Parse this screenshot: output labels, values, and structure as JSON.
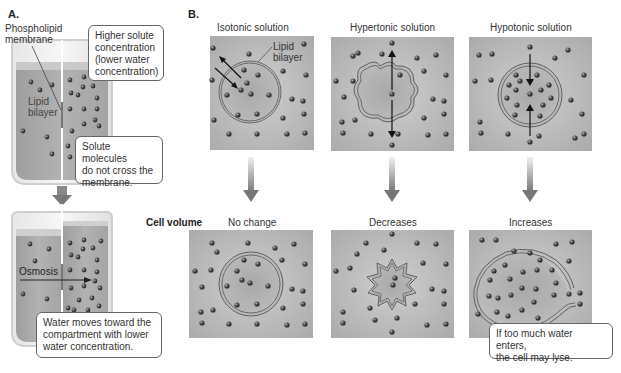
{
  "part_a": {
    "label": "A.",
    "membrane_label": "Phospholipid membrane",
    "membrane_label_line1": "Phospholipid",
    "membrane_label_line2": "membrane",
    "lipid_label_line1": "Lipid",
    "lipid_label_line2": "bilayer",
    "callout_concentration": "Higher solute concentration (lower water concentration)",
    "callout_concentration_lines": [
      "Higher solute",
      "concentration",
      "(lower water",
      "concentration)"
    ],
    "callout_solute": "Solute molecules do not cross the membrane.",
    "callout_solute_lines": [
      "Solute molecules",
      "do not cross the",
      "membrane."
    ],
    "osmosis_label": "Osmosis",
    "callout_water": "Water moves toward the compartment with lower water concentration.",
    "callout_water_lines": [
      "Water moves toward the",
      "compartment with lower",
      "water concentration."
    ]
  },
  "part_b": {
    "label": "B.",
    "row_label": "Cell volume",
    "lipid_label_line1": "Lipid",
    "lipid_label_line2": "bilayer",
    "columns": [
      {
        "solution": "Isotonic solution",
        "result": "No change"
      },
      {
        "solution": "Hypertonic solution",
        "result": "Decreases"
      },
      {
        "solution": "Hypotonic solution",
        "result": "Increases"
      }
    ],
    "callout_lyse": "If too much water enters, the cell may lyse.",
    "callout_lyse_lines": [
      "If too much water enters,",
      "the cell may lyse."
    ]
  },
  "colors": {
    "liquid": "#a9a9a9",
    "panel_bg": "#b5b5b5",
    "cell_fill": "#a3a3a3",
    "molecule": "#444444",
    "arrow": "#777777",
    "membrane_line": "#555555"
  }
}
